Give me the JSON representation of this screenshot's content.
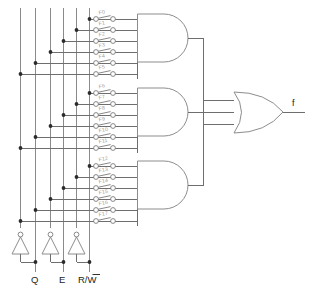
{
  "diagram": {
    "output_label": "f",
    "input_labels": [
      "Q",
      "E",
      "R/W"
    ],
    "input_label_overbar": [
      false,
      false,
      true
    ],
    "input_label_overbar_part": "W",
    "colors": {
      "wire": "#6e6e6e",
      "bus": "#8a8a8a",
      "gate": "#8d8d8d",
      "junction": "#2b2b2b",
      "fuse": "#7a7a7a",
      "fuse_label": "#9a9a9a",
      "text": "#1d1d1d",
      "background": "#ffffff"
    },
    "and_gates": [
      {
        "name": "and-gate-1",
        "fuse_rows": [
          "F0",
          "F1",
          "F2",
          "F3",
          "F4",
          "F5"
        ]
      },
      {
        "name": "and-gate-2",
        "fuse_rows": [
          "F6",
          "F7",
          "F8",
          "F9",
          "F10",
          "F11"
        ]
      },
      {
        "name": "and-gate-3",
        "fuse_rows": [
          "F12",
          "F13",
          "F14",
          "F15",
          "F16",
          "F17"
        ]
      }
    ],
    "or_gate": {
      "name": "or-gate",
      "inputs": 3
    },
    "inverters": [
      {
        "name": "inverter-q",
        "input": "Q"
      },
      {
        "name": "inverter-e",
        "input": "E"
      },
      {
        "name": "inverter-rw",
        "input": "R/W"
      }
    ],
    "fuse_labels_all": [
      "F0",
      "F1",
      "F2",
      "F3",
      "F4",
      "F5",
      "F6",
      "F7",
      "F8",
      "F9",
      "F10",
      "F11",
      "F12",
      "F13",
      "F14",
      "F15",
      "F16",
      "F17"
    ],
    "bus_count": 6,
    "fuse_count": 18
  }
}
